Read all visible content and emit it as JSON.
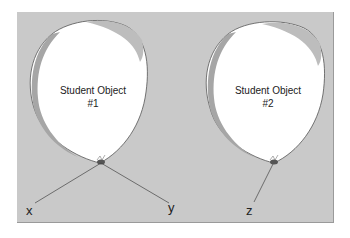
{
  "diagram": {
    "objects": [
      {
        "title": "Student Object",
        "number": "#1",
        "references": [
          "x",
          "y"
        ]
      },
      {
        "title": "Student Object",
        "number": "#2",
        "references": [
          "z"
        ]
      }
    ],
    "variables": {
      "x": "x",
      "y": "y",
      "z": "z"
    },
    "colors": {
      "background": "#c9c9c9",
      "balloon": "#ffffff",
      "shadow": "#9e9e9e",
      "outline": "#555555"
    }
  }
}
